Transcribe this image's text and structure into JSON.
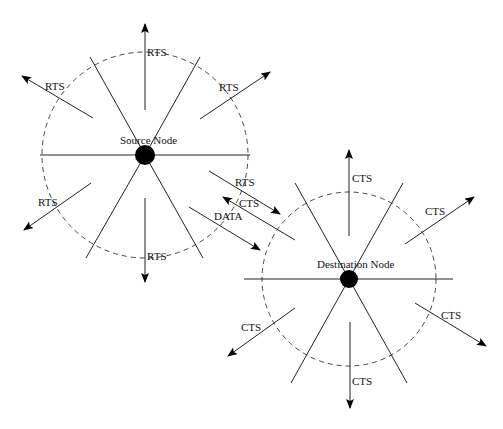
{
  "diagram": {
    "type": "RTS/CTS handshake illustration",
    "source_node": {
      "label": "Source Node",
      "center": [
        145,
        155
      ],
      "range_radius": 103,
      "rts_labels": [
        "RTS",
        "RTS",
        "RTS",
        "RTS",
        "RTS"
      ]
    },
    "destination_node": {
      "label": "Destination Node",
      "center": [
        349,
        279
      ],
      "range_radius": 87,
      "cts_labels": [
        "CTS",
        "CTS",
        "CTS",
        "CTS",
        "CTS"
      ]
    },
    "exchange": {
      "rts_label": "RTS",
      "cts_label": "CTS",
      "data_label": "DATA"
    }
  },
  "labels": {
    "src_top": "RTS",
    "src_upleft": "RTS",
    "src_upright": "RTS",
    "src_downleft": "RTS",
    "src_down": "RTS",
    "src_node": "Source Node",
    "ex_rts": "RTS",
    "ex_cts": "CTS",
    "ex_data": "DATA",
    "dst_top": "CTS",
    "dst_upright": "CTS",
    "dst_node": "Destination Node",
    "dst_downleft": "CTS",
    "dst_down": "CTS",
    "dst_downright": "CTS"
  }
}
